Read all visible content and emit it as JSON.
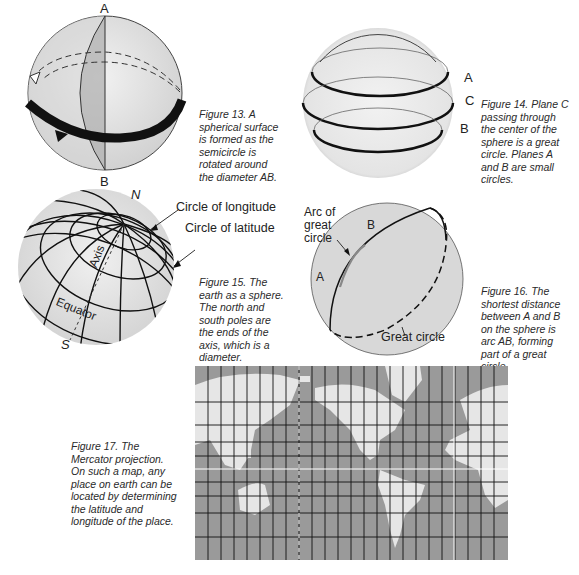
{
  "figures": [
    {
      "id": "fig13",
      "caption": "Figure 13. A\nspherical surface\nis formed as the\nsemicircle is\nrotated around\nthe diameter AB.",
      "labels": {
        "top": "A",
        "bottom": "B"
      }
    },
    {
      "id": "fig14",
      "caption": "Figure 14. Plane C\npassing through\nthe center of the\nsphere is a great\ncircle. Planes A\nand B are small\ncircles.",
      "labels": {
        "a": "A",
        "c": "C",
        "b": "B"
      }
    },
    {
      "id": "fig15",
      "caption": "Figure 15. The\nearth as a sphere.\nThe north and\nsouth poles are\nthe ends of the\naxis, which is a\ndiameter.",
      "labels": {
        "north": "N",
        "south": "S",
        "axis": "Axis",
        "equator": "Equator",
        "longitude": "Circle of longitude",
        "latitude": "Circle of latitude"
      }
    },
    {
      "id": "fig16",
      "caption": "Figure 16. The\nshortest distance\nbetween A and B\non the sphere is\narc AB, forming\npart of a great\ncircle.",
      "labels": {
        "arc": "Arc of\ngreat\ncircle",
        "a": "A",
        "b": "B",
        "great_circle": "Great circle"
      }
    },
    {
      "id": "fig17",
      "caption": "Figure 17. The\nMercator projection.\nOn such a map, any\nplace on earth can be\nlocated by determining\nthe latitude and\nlongitude of the place."
    }
  ],
  "colors": {
    "ocean": "#9a9a9a",
    "land": "#e6e6e6",
    "sphere_light": "#e8e8e8",
    "sphere_mid": "#c9c9c9",
    "sphere_dark": "#a8a8a8",
    "ink": "#111111"
  }
}
